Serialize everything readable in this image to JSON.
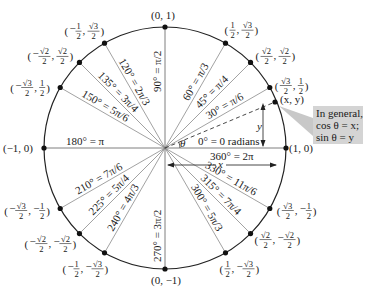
{
  "diagram": {
    "center": {
      "x": 165,
      "y": 148
    },
    "radius": 121,
    "colors": {
      "circle": "#222222",
      "ray": "#8a8a8a",
      "point": "#111111",
      "callout_bg": "#d4d4d4",
      "callout_pointer": "#c8c8c8"
    },
    "axis_labels": {
      "deg0": "0° = 0 radians",
      "deg360": "360° = 2π",
      "deg180": "180° = π",
      "deg90": "90° = π/2",
      "deg270": "270° = 3π/2"
    },
    "points": [
      {
        "deg": 0,
        "coord": "(1, 0)"
      },
      {
        "deg": 30,
        "coord_x": "√3/2",
        "coord_y": "1/2",
        "angle_label": "30° = π/6"
      },
      {
        "deg": 45,
        "coord_x": "√2/2",
        "coord_y": "√2/2",
        "angle_label": "45° = π/4"
      },
      {
        "deg": 60,
        "coord_x": "1/2",
        "coord_y": "√3/2",
        "angle_label": "60° = π/3"
      },
      {
        "deg": 90,
        "coord": "(0, 1)"
      },
      {
        "deg": 120,
        "coord_x": "−1/2",
        "coord_y": "√3/2",
        "angle_label": "120° = 2π/3"
      },
      {
        "deg": 135,
        "coord_x": "−√2/2",
        "coord_y": "√2/2",
        "angle_label": "135° = 3π/4"
      },
      {
        "deg": 150,
        "coord_x": "−√3/2",
        "coord_y": "1/2",
        "angle_label": "150° = 5π/6"
      },
      {
        "deg": 180,
        "coord": "(−1, 0)"
      },
      {
        "deg": 210,
        "coord_x": "−√3/2",
        "coord_y": "−1/2",
        "angle_label": "210° = 7π/6"
      },
      {
        "deg": 225,
        "coord_x": "−√2/2",
        "coord_y": "−√2/2",
        "angle_label": "225° = 5π/4"
      },
      {
        "deg": 240,
        "coord_x": "−1/2",
        "coord_y": "−√3/2",
        "angle_label": "240° = 4π/3"
      },
      {
        "deg": 270,
        "coord": "(0, −1)"
      },
      {
        "deg": 300,
        "coord_x": "1/2",
        "coord_y": "−√3/2",
        "angle_label": "300° = 5π/3"
      },
      {
        "deg": 315,
        "coord_x": "√2/2",
        "coord_y": "−√2/2",
        "angle_label": "315° = 7π/4"
      },
      {
        "deg": 330,
        "coord_x": "√3/2",
        "coord_y": "−1/2",
        "angle_label": "330° = 11π/6"
      }
    ],
    "general_point": {
      "label": "(x, y)",
      "theta_symbol": "θ",
      "x_label": "x",
      "y_label": "y"
    },
    "callout": {
      "line1": "In general,",
      "line2": "cos θ = x;",
      "line3": "sin θ = y"
    }
  }
}
